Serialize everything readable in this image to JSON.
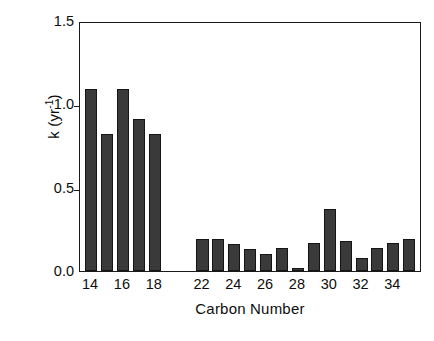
{
  "chart_data": {
    "type": "bar",
    "title": "",
    "xlabel": "Carbon Number",
    "ylabel": "k (yr-1)",
    "ylabel_base": "k (yr",
    "ylabel_exponent": "-1",
    "ylabel_close": ")",
    "categories": [
      14,
      15,
      16,
      17,
      18,
      19,
      20,
      21,
      22,
      23,
      24,
      25,
      26,
      27,
      28,
      29,
      30,
      31,
      32,
      33,
      34
    ],
    "values": [
      1.09,
      0.82,
      1.09,
      0.91,
      0.82,
      null,
      null,
      0.19,
      0.19,
      0.16,
      0.13,
      0.1,
      0.14,
      0.02,
      0.17,
      0.37,
      0.18,
      0.08,
      0.14,
      0.17,
      0.19
    ],
    "ylim": [
      0.0,
      1.5
    ],
    "xlim": [
      13.3,
      34.8
    ],
    "yticks": [
      0.0,
      0.5,
      1.0,
      1.5
    ],
    "ytick_labels": [
      "0.0",
      "0.5",
      "1.0",
      "1.5"
    ],
    "xticks": [
      14,
      16,
      18,
      20,
      22,
      24,
      26,
      28,
      30,
      32,
      34
    ],
    "xtick_labels": [
      "14",
      "16",
      "18",
      "22",
      "24",
      "26",
      "28",
      "30",
      "32",
      "34"
    ],
    "xtick_label_positions": [
      14,
      16,
      18,
      21,
      23,
      25,
      27,
      29,
      31,
      33
    ],
    "grid": false,
    "legend": null,
    "bar_color": "#3a3a3a",
    "edge_color": "#151515",
    "axis_color": "#1a1a1a"
  },
  "caption": {
    "text": ""
  }
}
